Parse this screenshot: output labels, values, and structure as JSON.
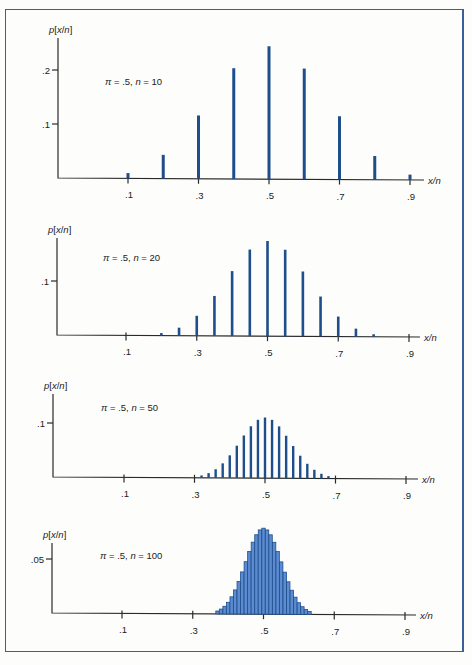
{
  "figure": {
    "y_label": "p[x/n]",
    "x_label": "x/n",
    "x_tick_labels": [
      ".1",
      ".3",
      ".5",
      ".7",
      ".9"
    ],
    "frame_color": "#3c5f99",
    "bar_color": "#1f4e8c"
  },
  "chart_data": [
    {
      "type": "bar",
      "title": "π = .5, n = 10",
      "annotation": "π = .5, n = 10",
      "xlabel": "x/n",
      "ylabel": "p[x/n]",
      "x_ticks": [
        0.1,
        0.3,
        0.5,
        0.7,
        0.9
      ],
      "y_ticks": [
        {
          "value": 0.1,
          "label": ".1"
        },
        {
          "value": 0.2,
          "label": ".2"
        }
      ],
      "x": [
        0.1,
        0.2,
        0.3,
        0.4,
        0.5,
        0.6,
        0.7,
        0.8,
        0.9
      ],
      "values": [
        0.0098,
        0.0439,
        0.1172,
        0.2051,
        0.2461,
        0.2051,
        0.1172,
        0.0439,
        0.0098
      ],
      "xlim": [
        0,
        1
      ],
      "ylim": [
        0,
        0.25
      ],
      "grid": false
    },
    {
      "type": "bar",
      "title": "π = .5, n = 20",
      "annotation": "π = .5, n = 20",
      "xlabel": "x/n",
      "ylabel": "p[x/n]",
      "x_ticks": [
        0.1,
        0.3,
        0.5,
        0.7,
        0.9
      ],
      "y_ticks": [
        {
          "value": 0.1,
          "label": ".1"
        }
      ],
      "x": [
        0.2,
        0.25,
        0.3,
        0.35,
        0.4,
        0.45,
        0.5,
        0.55,
        0.6,
        0.65,
        0.7,
        0.75,
        0.8
      ],
      "values": [
        0.0046,
        0.0148,
        0.037,
        0.0739,
        0.1201,
        0.1602,
        0.1762,
        0.1602,
        0.1201,
        0.0739,
        0.037,
        0.0148,
        0.0046
      ],
      "xlim": [
        0,
        1
      ],
      "ylim": [
        0,
        0.18
      ],
      "grid": false
    },
    {
      "type": "bar",
      "title": "π = .5, n = 50",
      "annotation": "π = .5, n = 50",
      "xlabel": "x/n",
      "ylabel": "p[x/n]",
      "x_ticks": [
        0.1,
        0.3,
        0.5,
        0.7,
        0.9
      ],
      "y_ticks": [
        {
          "value": 0.1,
          "label": ".1"
        }
      ],
      "x": [
        0.32,
        0.34,
        0.36,
        0.38,
        0.4,
        0.42,
        0.44,
        0.46,
        0.48,
        0.5,
        0.52,
        0.54,
        0.56,
        0.58,
        0.6,
        0.62,
        0.64,
        0.66,
        0.68
      ],
      "values": [
        0.0044,
        0.0087,
        0.016,
        0.027,
        0.0419,
        0.0598,
        0.0788,
        0.096,
        0.108,
        0.1123,
        0.108,
        0.096,
        0.0788,
        0.0598,
        0.0419,
        0.027,
        0.016,
        0.0087,
        0.0044
      ],
      "xlim": [
        0,
        1
      ],
      "ylim": [
        0,
        0.12
      ],
      "grid": false
    },
    {
      "type": "bar",
      "title": "π = .5, n = 100",
      "annotation": "π = .5, n = 100",
      "xlabel": "x/n",
      "ylabel": "p[x/n]",
      "x_ticks": [
        0.1,
        0.3,
        0.5,
        0.7,
        0.9
      ],
      "y_ticks": [
        {
          "value": 0.05,
          "label": ".05"
        }
      ],
      "x": [
        0.37,
        0.38,
        0.39,
        0.4,
        0.41,
        0.42,
        0.43,
        0.44,
        0.45,
        0.46,
        0.47,
        0.48,
        0.49,
        0.5,
        0.51,
        0.52,
        0.53,
        0.54,
        0.55,
        0.56,
        0.57,
        0.58,
        0.59,
        0.6,
        0.61,
        0.62,
        0.63
      ],
      "values": [
        0.0027,
        0.0045,
        0.0071,
        0.0108,
        0.0159,
        0.0223,
        0.0301,
        0.039,
        0.0485,
        0.058,
        0.0666,
        0.0735,
        0.078,
        0.0796,
        0.078,
        0.0735,
        0.0666,
        0.058,
        0.0485,
        0.039,
        0.0301,
        0.0223,
        0.0159,
        0.0108,
        0.0071,
        0.0045,
        0.0027
      ],
      "xlim": [
        0,
        1
      ],
      "ylim": [
        0,
        0.08
      ],
      "grid": false
    }
  ]
}
